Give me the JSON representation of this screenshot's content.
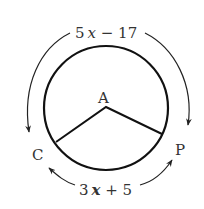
{
  "diagram": {
    "center_label": "A",
    "point_left": "C",
    "point_right": "P",
    "major_arc_label": "5x − 17",
    "minor_arc_label": "3x + 5",
    "major_arc_parts": {
      "coef": "5",
      "var": "x",
      "rest": " − 17"
    },
    "minor_arc_parts": {
      "coef": "3",
      "var": "x",
      "rest": " + 5"
    },
    "colors": {
      "stroke": "#111111",
      "text": "#333333"
    }
  }
}
